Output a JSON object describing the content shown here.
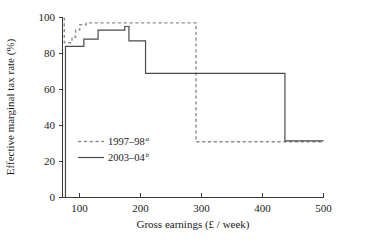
{
  "chart_data": {
    "type": "line",
    "title": "",
    "xlabel": "Gross earnings (£ / week)",
    "ylabel": "Effective marginal tax rate (%)",
    "xlim": [
      60,
      500
    ],
    "ylim": [
      0,
      100
    ],
    "xticks": [
      100,
      200,
      300,
      400,
      500
    ],
    "yticks": [
      0,
      20,
      40,
      60,
      80,
      100
    ],
    "xtick_labels": [
      "100",
      "200",
      "300",
      "400",
      "500"
    ],
    "ytick_labels": [
      "0",
      "20",
      "40",
      "60",
      "80",
      "100"
    ],
    "grid": false,
    "legend_position": "inside-lower-left",
    "drawstyle": "steps-post",
    "series": [
      {
        "name": "1997–98",
        "name_superscript": "a",
        "style": "dashed",
        "color": "#8d8d8d",
        "x": [
          63,
          63,
          70,
          76,
          82,
          89,
          100,
          150,
          200,
          250,
          278,
          285,
          285,
          340,
          400,
          460,
          500
        ],
        "y": [
          100,
          86,
          86,
          89,
          93,
          96,
          97,
          97,
          97,
          97,
          97,
          92,
          31,
          31,
          31,
          31,
          31
        ]
      },
      {
        "name": "2003–04",
        "name_superscript": "b",
        "style": "solid",
        "color": "#4a4a4a",
        "x": [
          65,
          65,
          78,
          96,
          120,
          140,
          165,
          172,
          200,
          250,
          300,
          350,
          400,
          435,
          470,
          500
        ],
        "y": [
          0,
          84,
          84,
          88,
          93,
          93,
          95,
          87,
          69,
          69,
          69,
          69,
          69,
          31.5,
          31.5,
          31.5
        ]
      }
    ],
    "annotations": []
  },
  "legend": {
    "entries": [
      {
        "label": "1997–98",
        "superscript": "a",
        "style": "dashed"
      },
      {
        "label": "2003–04",
        "superscript": "b",
        "style": "solid"
      }
    ]
  },
  "colors": {
    "axis": "#3a3a3a",
    "dashed_series": "#8d8d8d",
    "solid_series": "#4a4a4a",
    "background": "#ffffff",
    "text": "#1a1a1a"
  }
}
